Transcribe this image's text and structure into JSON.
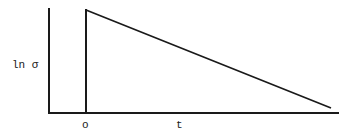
{
  "diagram": {
    "y_axis_label": "ln σ",
    "x_axis_label": "t",
    "origin_label": "o",
    "curve": {
      "shape": "instant rise at origin, then linear decay",
      "points": [
        {
          "t": 0,
          "ln_sigma": 0,
          "note": "at origin"
        },
        {
          "t": 0,
          "ln_sigma": "max",
          "note": "vertical jump"
        },
        {
          "t": "end",
          "ln_sigma": "near zero",
          "note": "linear decrease"
        }
      ]
    }
  }
}
